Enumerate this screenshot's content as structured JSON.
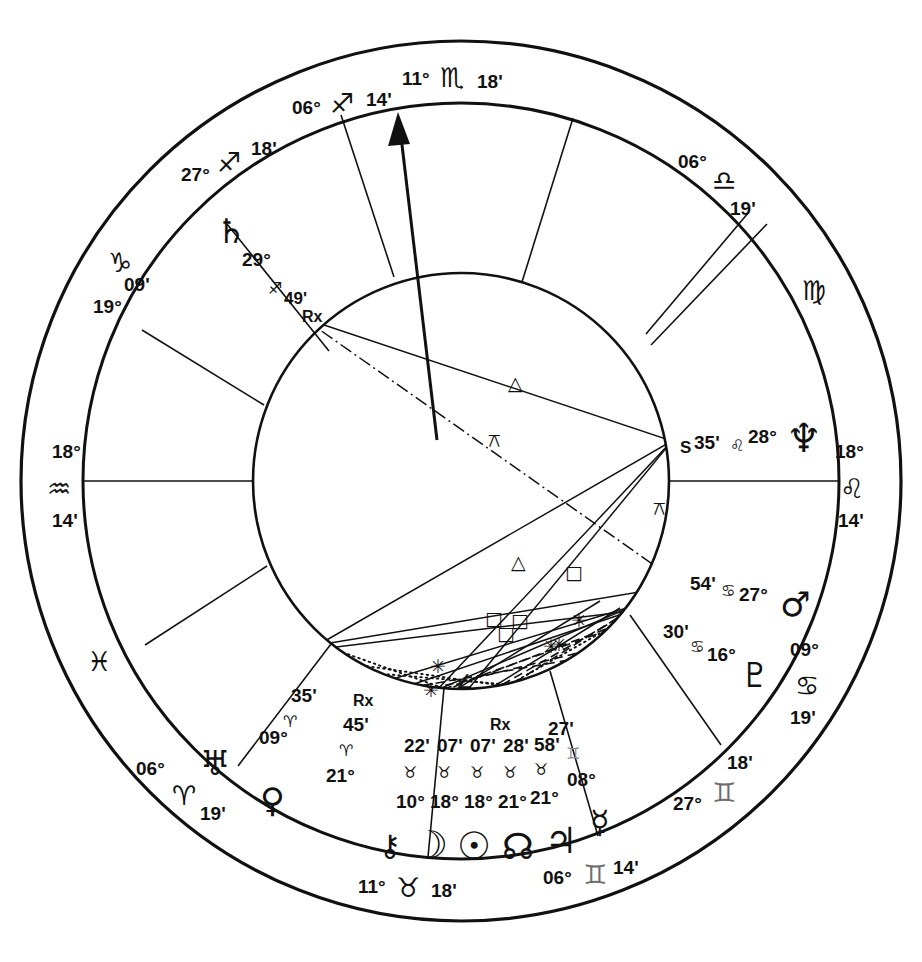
{
  "chart": {
    "type": "astrological-natal-wheel",
    "center": {
      "x": 461,
      "y": 481
    },
    "radii": {
      "outer": 440,
      "sign_ring_inner": 378,
      "house_ring_inner": 208
    },
    "background": "#ffffff",
    "line_color": "#111111",
    "gray_color": "#6d6d6d"
  },
  "house_cusps": [
    {
      "house": 1,
      "label_deg": "18°",
      "sign": "♒",
      "sign_name": "Aquarius",
      "label_min": "14'",
      "angle_deg": 180,
      "is_angle": true,
      "angle_name": "ASC"
    },
    {
      "house": 2,
      "label_deg": "06°",
      "sign": "♓",
      "sign_name": "Pisces",
      "label_min": "19'",
      "angle_deg": 208,
      "is_angle": false
    },
    {
      "house": 3,
      "label_deg": "06°",
      "sign": "♈",
      "sign_name": "Aries",
      "label_min": "19'",
      "angle_deg": 236,
      "is_angle": false
    },
    {
      "house": 4,
      "label_deg": "11°",
      "sign": "♉",
      "sign_name": "Taurus",
      "label_min": "18'",
      "angle_deg": 270,
      "is_angle": true,
      "angle_name": "IC"
    },
    {
      "house": 5,
      "label_deg": "06°",
      "sign": "♊",
      "sign_name": "Gemini",
      "label_min": "14'",
      "angle_deg": 297,
      "is_angle": false
    },
    {
      "house": 6,
      "label_deg": "27°",
      "sign": "♊",
      "sign_name": "Gemini",
      "label_min": "18'",
      "angle_deg": 322,
      "is_angle": false
    },
    {
      "house": 7,
      "label_deg": "18°",
      "sign": "♌",
      "sign_name": "Leo",
      "label_min": "14'",
      "angle_deg": 0,
      "is_angle": true,
      "angle_name": "DSC"
    },
    {
      "house": 8,
      "label_deg": "06°",
      "sign": "♍",
      "sign_name": "Virgo",
      "label_min": "19'",
      "angle_deg": 28,
      "is_angle": false
    },
    {
      "house": 9,
      "label_deg": "06°",
      "sign": "♎",
      "sign_name": "Libra",
      "label_min": "19'",
      "angle_deg": 56,
      "is_angle": false
    },
    {
      "house": 10,
      "label_deg": "11°",
      "sign": "♏",
      "sign_name": "Scorpio",
      "label_min": "18'",
      "angle_deg": 90,
      "is_angle": true,
      "angle_name": "MC"
    },
    {
      "house": 11,
      "label_deg": "06°",
      "sign": "♐",
      "sign_name": "Sagittarius",
      "label_min": "14'",
      "angle_deg": 117,
      "is_angle": false
    },
    {
      "house": 12,
      "label_deg": "27°",
      "sign": "♐",
      "sign_name": "Sagittarius",
      "label_min": "18'",
      "angle_deg": 142,
      "is_angle": false
    },
    {
      "house": 13,
      "label_deg": "19°",
      "sign": "♑",
      "sign_name": "Capricorn",
      "label_min": "09'",
      "angle_deg": 159,
      "is_angle": false
    }
  ],
  "outer_labels": [
    {
      "name": "mc-label",
      "deg": "11°",
      "sign": "♏",
      "min": "18'",
      "x": 461,
      "y": 78,
      "gray": false
    },
    {
      "name": "house11-label",
      "deg": "06°",
      "sign": "♐",
      "min": "14'",
      "x": 345,
      "y": 108,
      "gray": false
    },
    {
      "name": "house12-label",
      "deg": "27°",
      "sign": "♐",
      "min": "18'",
      "x": 228,
      "y": 178,
      "gray": false
    },
    {
      "name": "house13-label",
      "deg": "19°",
      "sign": "♑",
      "min": "09'",
      "x": 137,
      "y": 277,
      "gray": false
    },
    {
      "name": "asc-label",
      "deg": "18°",
      "sign": "♒",
      "min": "14'",
      "x": 65,
      "y": 481,
      "gray": false
    },
    {
      "name": "house2-label",
      "deg": "06°",
      "sign": "♓",
      "min": "19'",
      "x": 108,
      "y": 660,
      "gray": false
    },
    {
      "name": "house3-label",
      "deg": "06°",
      "sign": "♈",
      "min": "19'",
      "x": 196,
      "y": 792,
      "gray": false
    },
    {
      "name": "ic-label",
      "deg": "11°",
      "sign": "♉",
      "min": "18'",
      "x": 430,
      "y": 888,
      "gray": false
    },
    {
      "name": "house5-label",
      "deg": "06°",
      "sign": "♊",
      "min": "14'",
      "x": 625,
      "y": 872,
      "gray": true
    },
    {
      "name": "house6-label",
      "deg": "27°",
      "sign": "♊",
      "min": "18'",
      "x": 749,
      "y": 785,
      "gray": true
    },
    {
      "name": "house7-label",
      "deg": "18°",
      "sign": "♌",
      "min": "14'",
      "x": 856,
      "y": 481,
      "gray": false
    },
    {
      "name": "house8-label",
      "deg": "06°",
      "sign": "♍",
      "min": "19'",
      "x": 815,
      "y": 295,
      "gray": false
    },
    {
      "name": "house9-label",
      "deg": "06°",
      "sign": "♎",
      "min": "19'",
      "x": 735,
      "y": 175,
      "gray": false
    },
    {
      "name": "cancer-outer",
      "deg": "09°",
      "sign": "♋",
      "min": "19'",
      "x": 815,
      "y": 665,
      "gray": false
    }
  ],
  "planets": [
    {
      "name": "saturn",
      "glyph": "♄",
      "deg": "29°",
      "sign": "♐",
      "sign_name": "Sagittarius",
      "min": "49'",
      "retrograde": "Rx",
      "station": "",
      "x": 245,
      "y": 235
    },
    {
      "name": "neptune",
      "glyph": "♆",
      "deg": "28°",
      "sign": "♌",
      "sign_name": "Leo",
      "min": "35'",
      "retrograde": "",
      "station": "S",
      "x": 800,
      "y": 440
    },
    {
      "name": "mars",
      "glyph": "♂",
      "deg": "27°",
      "sign": "♋",
      "sign_name": "Cancer",
      "min": "54'",
      "retrograde": "",
      "station": "",
      "x": 795,
      "y": 600
    },
    {
      "name": "pluto",
      "glyph": "♇",
      "deg": "16°",
      "sign": "♋",
      "sign_name": "Cancer",
      "min": "30'",
      "retrograde": "",
      "station": "",
      "x": 755,
      "y": 672
    },
    {
      "name": "mercury",
      "glyph": "☿",
      "deg": "08°",
      "sign": "♊",
      "sign_name": "Gemini",
      "min": "27'",
      "retrograde": "",
      "station": "",
      "x": 561,
      "y": 800
    },
    {
      "name": "jupiter",
      "glyph": "♃",
      "deg": "21°",
      "sign": "♉",
      "sign_name": "Taurus",
      "min": "58'",
      "retrograde": "",
      "station": "",
      "x": 516,
      "y": 825
    },
    {
      "name": "north-node",
      "glyph": "☊",
      "deg": "21°",
      "sign": "♉",
      "sign_name": "Taurus",
      "min": "28'",
      "retrograde": "Rx",
      "station": "",
      "x": 466,
      "y": 833
    },
    {
      "name": "sun",
      "glyph": "☉",
      "deg": "18°",
      "sign": "♉",
      "sign_name": "Taurus",
      "min": "07'",
      "retrograde": "",
      "station": "",
      "x": 420,
      "y": 835
    },
    {
      "name": "moon",
      "glyph": "☽",
      "deg": "18°",
      "sign": "♉",
      "sign_name": "Taurus",
      "min": "07'",
      "retrograde": "",
      "station": "",
      "x": 375,
      "y": 833
    },
    {
      "name": "chiron",
      "glyph": "⚷",
      "deg": "10°",
      "sign": "♉",
      "sign_name": "Taurus",
      "min": "22'",
      "retrograde": "",
      "station": "",
      "x": 329,
      "y": 825
    },
    {
      "name": "venus",
      "glyph": "♀",
      "deg": "21°",
      "sign": "♈",
      "sign_name": "Aries",
      "min": "45'",
      "retrograde": "Rx",
      "station": "",
      "x": 272,
      "y": 795
    },
    {
      "name": "uranus",
      "glyph": "♅",
      "deg": "09°",
      "sign": "♈",
      "sign_name": "Aries",
      "min": "35'",
      "retrograde": "",
      "station": "",
      "x": 215,
      "y": 757
    }
  ],
  "planet_text_groups": [
    {
      "name": "saturn-text",
      "glyph": "♄",
      "gx": 228,
      "gy": 230,
      "deg": "29°",
      "dx": 262,
      "dy": 257,
      "sign": "♐",
      "sx": 274,
      "sy": 283,
      "min": "49'",
      "mx": 290,
      "my": 296,
      "rx": "Rx",
      "rxx": 308,
      "rxy": 316
    },
    {
      "name": "neptune-text",
      "glyph": "♆",
      "gx": 797,
      "gy": 444,
      "station": "S",
      "stx": 688,
      "sty": 449,
      "min": "35'",
      "mx": 712,
      "my": 443,
      "sign": "♌",
      "sx": 739,
      "sy": 444,
      "deg": "28°",
      "dx": 762,
      "dy": 438
    },
    {
      "name": "mars-text",
      "glyph": "♂",
      "gx": 793,
      "gy": 600,
      "min": "54'",
      "mx": 700,
      "my": 578,
      "sign": "♋",
      "sx": 724,
      "sy": 583,
      "deg": "27°",
      "dx": 750,
      "dy": 589
    },
    {
      "name": "pluto-text",
      "glyph": "♇",
      "gx": 752,
      "gy": 675,
      "min": "30'",
      "mx": 676,
      "my": 629,
      "sign": "♋",
      "sx": 698,
      "sy": 641,
      "deg": "16°",
      "dx": 719,
      "dy": 648
    },
    {
      "name": "uranus-text",
      "glyph": "♅",
      "gx": 211,
      "gy": 762,
      "min": "35'",
      "mx": 303,
      "my": 694,
      "sign": "♈",
      "sx": 290,
      "sy": 717,
      "deg": "09°",
      "dx": 275,
      "dy": 736
    },
    {
      "name": "venus-text",
      "glyph": "♀",
      "gx": 272,
      "gy": 800,
      "min": "45'",
      "mx": 355,
      "my": 720,
      "sign": "♈",
      "sx": 345,
      "sy": 745,
      "deg": "21°",
      "dx": 337,
      "dy": 772,
      "rx": "Rx",
      "rxx": 358,
      "rxy": 699
    }
  ],
  "cluster": {
    "name": "taurus-stellium",
    "mins": [
      {
        "v": "22'",
        "x": 416,
        "y": 745
      },
      {
        "v": "07'",
        "x": 451,
        "y": 745
      },
      {
        "v": "07'",
        "x": 484,
        "y": 745
      },
      {
        "v": "28'",
        "x": 516,
        "y": 745
      },
      {
        "v": "58'",
        "x": 547,
        "y": 744
      }
    ],
    "signs": [
      {
        "v": "♉",
        "x": 410,
        "y": 770
      },
      {
        "v": "♉",
        "x": 443,
        "y": 770
      },
      {
        "v": "♉",
        "x": 476,
        "y": 770
      },
      {
        "v": "♉",
        "x": 509,
        "y": 770
      },
      {
        "v": "♉",
        "x": 541,
        "y": 767
      }
    ],
    "degs": [
      {
        "v": "10°",
        "x": 409,
        "y": 800
      },
      {
        "v": "18°",
        "x": 443,
        "y": 800
      },
      {
        "v": "18°",
        "x": 477,
        "y": 800
      },
      {
        "v": "21°",
        "x": 511,
        "y": 800
      },
      {
        "v": "21°",
        "x": 544,
        "y": 796
      }
    ],
    "glyphs": [
      {
        "v": "⚷",
        "x": 390,
        "y": 845,
        "size": 30
      },
      {
        "v": "☽",
        "x": 429,
        "y": 847,
        "size": 38
      },
      {
        "v": "☉",
        "x": 473,
        "y": 848,
        "size": 38
      },
      {
        "v": "☊",
        "x": 517,
        "y": 848,
        "size": 36
      },
      {
        "v": "♃",
        "x": 558,
        "y": 843,
        "size": 36
      }
    ],
    "retrograde_marks": [
      {
        "v": "Rx",
        "x": 496,
        "y": 723
      }
    ],
    "mercury": {
      "deg": "08°",
      "min": "27'",
      "sign": "♊",
      "glyph": "☿",
      "deg_x": 582,
      "deg_y": 779,
      "min_x": 556,
      "min_y": 728,
      "sign_x": 571,
      "sign_y": 752,
      "glyph_x": 600,
      "glyph_y": 822
    }
  },
  "aspect_symbols": [
    {
      "name": "trine-upper",
      "glyph": "△",
      "x": 515,
      "y": 383
    },
    {
      "name": "quincunx-upper",
      "glyph": "⚻",
      "x": 496,
      "y": 440
    },
    {
      "name": "trine-lower",
      "glyph": "△",
      "x": 518,
      "y": 562
    },
    {
      "name": "square-a",
      "glyph": "□",
      "x": 572,
      "y": 572
    },
    {
      "name": "square-b",
      "glyph": "□",
      "x": 518,
      "y": 620
    },
    {
      "name": "square-c",
      "glyph": "□",
      "x": 492,
      "y": 618
    },
    {
      "name": "square-d",
      "glyph": "□",
      "x": 504,
      "y": 633
    },
    {
      "name": "quincunx-right",
      "glyph": "⚻",
      "x": 660,
      "y": 508
    },
    {
      "name": "sextile-a",
      "glyph": "✳",
      "x": 578,
      "y": 620
    },
    {
      "name": "sextile-b",
      "glyph": "✳",
      "x": 558,
      "y": 644
    },
    {
      "name": "sextile-c",
      "glyph": "✳",
      "x": 549,
      "y": 646
    },
    {
      "name": "sextile-d",
      "glyph": "✳",
      "x": 437,
      "y": 666
    },
    {
      "name": "semisquare",
      "glyph": "∠",
      "x": 463,
      "y": 681
    },
    {
      "name": "sextile-e",
      "glyph": "✳",
      "x": 430,
      "y": 690
    }
  ],
  "aspect_lines": [
    {
      "name": "saturn-neptune-trine",
      "style": "solid",
      "x1": 303,
      "y1": 318,
      "x2": 672,
      "y2": 441
    },
    {
      "name": "saturn-pluto-quincunx",
      "style": "dashdot",
      "x1": 303,
      "y1": 318,
      "x2": 678,
      "y2": 581
    },
    {
      "name": "neptune-venus-trine",
      "style": "solid",
      "x1": 672,
      "y1": 441,
      "x2": 330,
      "y2": 648
    },
    {
      "name": "neptune-sun-line",
      "style": "solid",
      "x1": 672,
      "y1": 441,
      "x2": 440,
      "y2": 688
    },
    {
      "name": "neptune-moon-line",
      "style": "solid",
      "x1": 672,
      "y1": 441,
      "x2": 470,
      "y2": 692
    },
    {
      "name": "neptune-node-dot",
      "style": "dotted",
      "x1": 672,
      "y1": 441,
      "x2": 540,
      "y2": 689
    },
    {
      "name": "mars-venus-line",
      "style": "solid",
      "x1": 678,
      "y1": 581,
      "x2": 330,
      "y2": 648
    },
    {
      "name": "mars-sun-line",
      "style": "solid",
      "x1": 678,
      "y1": 581,
      "x2": 440,
      "y2": 688
    },
    {
      "name": "mars-jupiter-dash",
      "style": "dashed",
      "x1": 678,
      "y1": 581,
      "x2": 500,
      "y2": 693
    },
    {
      "name": "pluto-uranus-line",
      "style": "solid",
      "x1": 648,
      "y1": 609,
      "x2": 330,
      "y2": 648
    },
    {
      "name": "pluto-moon-dash",
      "style": "dashed",
      "x1": 648,
      "y1": 609,
      "x2": 455,
      "y2": 691
    },
    {
      "name": "cluster-inner-a",
      "style": "solid",
      "x1": 400,
      "y1": 680,
      "x2": 640,
      "y2": 604
    },
    {
      "name": "cluster-inner-b",
      "style": "solid",
      "x1": 412,
      "y1": 687,
      "x2": 630,
      "y2": 610
    },
    {
      "name": "cluster-dot-a",
      "style": "dotted",
      "x1": 332,
      "y1": 650,
      "x2": 470,
      "y2": 697
    },
    {
      "name": "cluster-dot-b",
      "style": "dotted",
      "x1": 355,
      "y1": 668,
      "x2": 530,
      "y2": 693
    },
    {
      "name": "cluster-dash-a",
      "style": "dashed",
      "x1": 410,
      "y1": 690,
      "x2": 560,
      "y2": 674
    },
    {
      "name": "cluster-dash-b",
      "style": "dashed",
      "x1": 418,
      "y1": 692,
      "x2": 575,
      "y2": 660
    }
  ],
  "mc_arrow": {
    "name": "mc-arrow",
    "from_x": 437,
    "from_y": 440,
    "to_x": 398,
    "to_y": 118
  }
}
